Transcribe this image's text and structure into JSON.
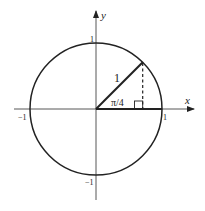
{
  "diagram": {
    "axes": {
      "x_label": "x",
      "y_label": "y"
    },
    "ticks": {
      "x_pos": "1",
      "x_neg": "−1",
      "y_pos": "1",
      "y_neg": "−1"
    },
    "annotations": {
      "hypotenuse_label": "1",
      "angle_label": "π/4"
    },
    "colors": {
      "stroke": "#222222",
      "background": "#ffffff"
    }
  }
}
